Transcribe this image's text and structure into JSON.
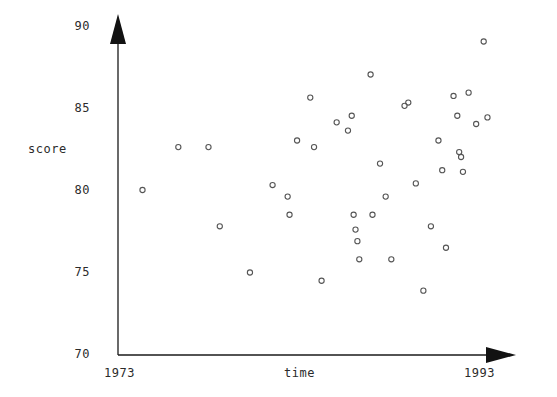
{
  "chart_data": {
    "type": "scatter",
    "title": "",
    "xlabel": "time",
    "ylabel": "score",
    "xlim": [
      1973,
      1993
    ],
    "ylim": [
      70,
      90
    ],
    "grid": false,
    "legend": null,
    "x_axis_endpoints": [
      "1973",
      "1993"
    ],
    "yticks": [
      70,
      75,
      80,
      85,
      90
    ],
    "ytick_labels": [
      "70",
      "75",
      "80",
      "85",
      "90"
    ],
    "xticks": [],
    "marker": "open-circle",
    "marker_color": "#555555",
    "axis_color": "#1a1a1a",
    "points": [
      {
        "x": 1974.3,
        "y": 80.0
      },
      {
        "x": 1976.2,
        "y": 82.6
      },
      {
        "x": 1977.8,
        "y": 82.6
      },
      {
        "x": 1978.4,
        "y": 77.8
      },
      {
        "x": 1980.0,
        "y": 75.0
      },
      {
        "x": 1981.2,
        "y": 80.3
      },
      {
        "x": 1982.0,
        "y": 79.6
      },
      {
        "x": 1982.1,
        "y": 78.5
      },
      {
        "x": 1982.5,
        "y": 83.0
      },
      {
        "x": 1983.2,
        "y": 85.6
      },
      {
        "x": 1983.4,
        "y": 82.6
      },
      {
        "x": 1983.8,
        "y": 74.5
      },
      {
        "x": 1984.6,
        "y": 84.1
      },
      {
        "x": 1985.2,
        "y": 83.6
      },
      {
        "x": 1985.4,
        "y": 84.5
      },
      {
        "x": 1985.5,
        "y": 78.5
      },
      {
        "x": 1985.6,
        "y": 77.6
      },
      {
        "x": 1985.7,
        "y": 76.9
      },
      {
        "x": 1985.8,
        "y": 75.8
      },
      {
        "x": 1986.4,
        "y": 87.0
      },
      {
        "x": 1986.5,
        "y": 78.5
      },
      {
        "x": 1986.9,
        "y": 81.6
      },
      {
        "x": 1987.2,
        "y": 79.6
      },
      {
        "x": 1987.5,
        "y": 75.8
      },
      {
        "x": 1988.2,
        "y": 85.1
      },
      {
        "x": 1988.4,
        "y": 85.3
      },
      {
        "x": 1988.8,
        "y": 80.4
      },
      {
        "x": 1989.2,
        "y": 73.9
      },
      {
        "x": 1989.6,
        "y": 77.8
      },
      {
        "x": 1990.0,
        "y": 83.0
      },
      {
        "x": 1990.2,
        "y": 81.2
      },
      {
        "x": 1990.4,
        "y": 76.5
      },
      {
        "x": 1990.8,
        "y": 85.7
      },
      {
        "x": 1991.0,
        "y": 84.5
      },
      {
        "x": 1991.1,
        "y": 82.3
      },
      {
        "x": 1991.2,
        "y": 82.0
      },
      {
        "x": 1991.3,
        "y": 81.1
      },
      {
        "x": 1991.6,
        "y": 85.9
      },
      {
        "x": 1992.0,
        "y": 84.0
      },
      {
        "x": 1992.4,
        "y": 89.0
      },
      {
        "x": 1992.6,
        "y": 84.4
      }
    ]
  },
  "labels": {
    "ylabel": "score",
    "xlabel": "time",
    "x_start": "1973",
    "x_end": "1993",
    "y0": "70",
    "y1": "75",
    "y2": "80",
    "y3": "85",
    "y4": "90"
  }
}
